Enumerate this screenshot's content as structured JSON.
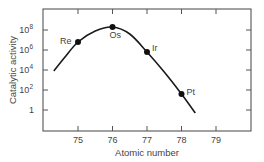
{
  "chart_data": {
    "type": "line",
    "title": "",
    "xlabel": "Atomic number",
    "ylabel": "Catalytic activity",
    "xlim": [
      74.0,
      80.0
    ],
    "ylim_log10": [
      -1.0,
      10.0
    ],
    "yscale": "log",
    "grid": false,
    "legend": "none",
    "x_ticks": [
      75,
      76,
      77,
      78,
      79
    ],
    "y_ticks": [
      {
        "label": "1",
        "exp": "",
        "log10": 0
      },
      {
        "label": "10",
        "exp": "2",
        "log10": 2
      },
      {
        "label": "10",
        "exp": "4",
        "log10": 4
      },
      {
        "label": "10",
        "exp": "6",
        "log10": 6
      },
      {
        "label": "10",
        "exp": "8",
        "log10": 8
      }
    ],
    "points": [
      {
        "label": "Re",
        "x": 75,
        "log10_y": 6.8
      },
      {
        "label": "Os",
        "x": 76,
        "log10_y": 8.3
      },
      {
        "label": "Ir",
        "x": 77,
        "log10_y": 5.8
      },
      {
        "label": "Pt",
        "x": 78,
        "log10_y": 1.6
      }
    ],
    "curve": [
      {
        "x": 74.3,
        "log10_y": 3.9
      },
      {
        "x": 74.6,
        "log10_y": 5.2
      },
      {
        "x": 75.0,
        "log10_y": 6.8
      },
      {
        "x": 75.5,
        "log10_y": 7.9
      },
      {
        "x": 76.0,
        "log10_y": 8.3
      },
      {
        "x": 76.5,
        "log10_y": 7.6
      },
      {
        "x": 77.0,
        "log10_y": 5.8
      },
      {
        "x": 77.5,
        "log10_y": 3.8
      },
      {
        "x": 78.0,
        "log10_y": 1.6
      },
      {
        "x": 78.4,
        "log10_y": -0.3
      }
    ]
  }
}
